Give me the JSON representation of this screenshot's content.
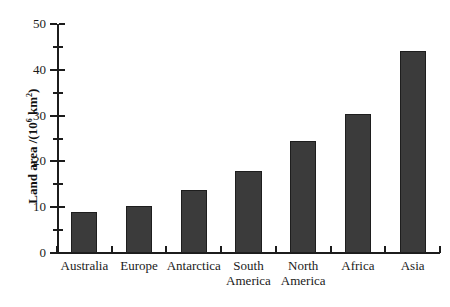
{
  "chart_data": {
    "type": "bar",
    "title": "",
    "subtitle": "",
    "xlabel": "",
    "ylabel": "Land area /(10^6 km^2)",
    "ylabel_parts": {
      "prefix": "Land area /(10",
      "exponent": "6",
      "middle": " km",
      "exponent2": "2",
      "suffix": ")"
    },
    "categories": [
      "Australia",
      "Europe",
      "Antarctica",
      "South America",
      "North America",
      "Africa",
      "Asia"
    ],
    "category_lines": [
      [
        "Australia"
      ],
      [
        "Europe"
      ],
      [
        "Antarctica"
      ],
      [
        "South",
        "America"
      ],
      [
        "North",
        "America"
      ],
      [
        "Africa"
      ],
      [
        "Asia"
      ]
    ],
    "values": [
      9.0,
      10.2,
      13.7,
      17.8,
      24.5,
      30.4,
      44.0
    ],
    "ylim": [
      0,
      50
    ],
    "ytick_major": [
      0,
      10,
      20,
      30,
      40,
      50
    ],
    "ytick_major_labels": [
      "0",
      "10",
      "20",
      "30",
      "40",
      "50"
    ],
    "ytick_minor": [
      5,
      15,
      25,
      35,
      45
    ],
    "grid": false,
    "legend": false,
    "legend_position": "none",
    "bar_color": "#3b3b3b",
    "bar_edge_color": "#1e1e1e",
    "axis_color": "#1c1c1c",
    "background_color": "#ffffff"
  },
  "scan_artifact": {
    "top_band_text": "· · ·      ·  · ·        ·                      ·"
  }
}
